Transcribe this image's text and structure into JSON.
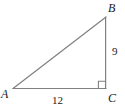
{
  "figure": {
    "kind": "right-triangle-diagram",
    "background_color": "#ffffff",
    "stroke_color": "#808080",
    "label_color": "#1a1a1a",
    "width": 125,
    "height": 109,
    "vertices": {
      "A": {
        "label": "A",
        "x": 13,
        "y": 88
      },
      "B": {
        "label": "B",
        "x": 106,
        "y": 17
      },
      "C": {
        "label": "C",
        "x": 106,
        "y": 88
      }
    },
    "sides": {
      "vertical_leg": {
        "label": "9",
        "from": "B",
        "to": "C",
        "value": 9
      },
      "horizontal_leg": {
        "label": "12",
        "from": "A",
        "to": "C",
        "value": 12
      },
      "hypotenuse": {
        "label": "",
        "from": "A",
        "to": "B"
      }
    },
    "right_angle": {
      "at_vertex": "C",
      "marker": "square",
      "size": 7
    }
  }
}
